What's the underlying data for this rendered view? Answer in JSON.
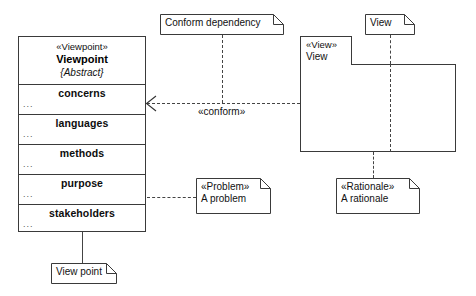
{
  "diagram": {
    "type": "uml-class-diagram"
  },
  "viewpoint_class": {
    "stereotype": "«Viewpoint»",
    "name": "Viewpoint",
    "abstract": "{Abstract}",
    "compartments": [
      {
        "title": "concerns",
        "dots": "..."
      },
      {
        "title": "languages",
        "dots": "..."
      },
      {
        "title": "methods",
        "dots": "..."
      },
      {
        "title": "purpose",
        "dots": "..."
      },
      {
        "title": "stakeholders",
        "dots": "..."
      }
    ]
  },
  "view_package": {
    "stereotype": "«View»",
    "name": "View"
  },
  "notes": {
    "conform_dependency": {
      "text": "Conform dependency"
    },
    "view": {
      "text": "View"
    },
    "problem": {
      "stereotype": "«Problem»",
      "text": "A problem"
    },
    "rationale": {
      "stereotype": "«Rationale»",
      "text": "A rationale"
    },
    "view_point": {
      "text": "View point"
    }
  },
  "edges": {
    "conform_label": "«conform»"
  },
  "colors": {
    "stroke": "#3a3a3a",
    "dashed": "#444444",
    "background": "#ffffff",
    "text": "#111111"
  }
}
